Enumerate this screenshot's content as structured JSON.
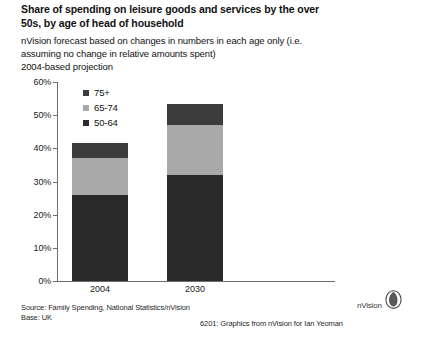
{
  "title": "Share of spending on leisure goods and services by the over 50s, by age of head of household",
  "subtitle_lines": [
    "nVision forecast based on changes in numbers in each age only (i.e.",
    "assuming no change in relative amounts spent)",
    "2004-based projection"
  ],
  "footer": {
    "source": "Source: Family Spending, National Statistics/nVision",
    "base": "Base: UK",
    "credit": "6201: Graphics from  nVision  for Ian Yeoman",
    "logo_text": "nVision",
    "logo_mark": "nvision-circle-logo"
  },
  "colors": {
    "age_75_plus": "#3c3c3c",
    "age_65_74": "#a9a9a9",
    "age_50_64": "#2a2a2a",
    "axis": "#6d6d6d",
    "background": "#ffffff"
  },
  "chart_data": {
    "type": "bar",
    "stacked": true,
    "title": "Share of spending on leisure goods and services by the over 50s, by age of head of household",
    "subtitle": "nVision forecast based on changes in numbers in each age only (i.e. assuming no change in relative amounts spent). 2004-based projection",
    "xlabel": "",
    "ylabel": "",
    "categories": [
      "2004",
      "2030"
    ],
    "ylim": [
      0,
      60
    ],
    "ytick_labels": [
      "60%",
      "50%",
      "40%",
      "30%",
      "20%",
      "10%",
      "0%"
    ],
    "ytick_values": [
      60,
      50,
      40,
      30,
      20,
      10,
      0
    ],
    "grid": false,
    "legend_position": "inside-top-left",
    "unit": "%",
    "series": [
      {
        "name": "75+",
        "color": "#3c3c3c",
        "values": [
          4.5,
          6.5
        ]
      },
      {
        "name": "65-74",
        "color": "#a9a9a9",
        "values": [
          11.0,
          15.0
        ]
      },
      {
        "name": "50-64",
        "color": "#2a2a2a",
        "values": [
          26.0,
          32.0
        ]
      }
    ],
    "totals": [
      41.5,
      53.5
    ]
  }
}
